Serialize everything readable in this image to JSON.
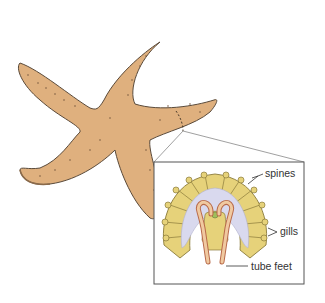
{
  "figure": {
    "inset_title": "arm cross-section",
    "labels": {
      "spines": "spines",
      "gills": "gills",
      "tube_feet": "tube feet"
    }
  },
  "colors": {
    "body": "#dfb07e",
    "body_outline": "#5a4a3a",
    "spine_plate": "#e6d27a",
    "spine_outline": "#8a7a3a",
    "coelom": "#d9d9ee",
    "tube_feet": "#f0c9a0",
    "tube_feet_outline": "#b86a4a",
    "box_border": "#555555"
  }
}
